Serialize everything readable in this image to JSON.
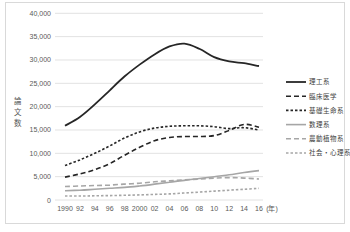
{
  "chart_data": {
    "type": "line",
    "title": "",
    "ylabel": "論文数",
    "x_unit_label": "(年)",
    "categories": [
      1990,
      1992,
      1994,
      1996,
      1998,
      2000,
      2002,
      2004,
      2006,
      2008,
      2010,
      2012,
      2014,
      2016
    ],
    "x_tick_labels": [
      "1990",
      "92",
      "94",
      "96",
      "98",
      "2000",
      "02",
      "04",
      "06",
      "08",
      "10",
      "12",
      "14",
      "16"
    ],
    "ylim": [
      0,
      40000
    ],
    "ytick_step": 5000,
    "y_tick_labels": [
      "0",
      "5,000",
      "10,000",
      "15,000",
      "20,000",
      "25,000",
      "30,000",
      "35,000",
      "40,000"
    ],
    "grid": "horizontal",
    "legend_position": "right",
    "series": [
      {
        "name": "理工系",
        "color": "#262626",
        "style": "solid",
        "width": 1.8,
        "values": [
          15900,
          17800,
          20500,
          23500,
          26500,
          29000,
          31200,
          32900,
          33500,
          32400,
          30600,
          29700,
          29300,
          28700
        ]
      },
      {
        "name": "臨床医学",
        "color": "#262626",
        "style": "dash",
        "width": 1.6,
        "values": [
          4900,
          5600,
          6500,
          7800,
          9600,
          11300,
          12700,
          13400,
          13600,
          13600,
          13800,
          14900,
          16200,
          15600
        ]
      },
      {
        "name": "基礎生命系",
        "color": "#262626",
        "style": "short-dash",
        "width": 1.6,
        "values": [
          7400,
          8600,
          10000,
          11600,
          13300,
          14600,
          15400,
          15800,
          15900,
          15900,
          15700,
          15300,
          15500,
          15000
        ]
      },
      {
        "name": "数理系",
        "color": "#a6a6a6",
        "style": "solid",
        "width": 1.6,
        "values": [
          2000,
          2100,
          2300,
          2500,
          2700,
          3000,
          3400,
          3800,
          4200,
          4600,
          5000,
          5400,
          5900,
          6300
        ]
      },
      {
        "name": "農動植物系",
        "color": "#a6a6a6",
        "style": "dash",
        "width": 1.6,
        "values": [
          2900,
          3000,
          3100,
          3200,
          3400,
          3600,
          3900,
          4100,
          4300,
          4500,
          4700,
          4800,
          4700,
          4500
        ]
      },
      {
        "name": "社会・心理系",
        "color": "#a6a6a6",
        "style": "short-dash",
        "width": 1.6,
        "values": [
          850,
          850,
          900,
          950,
          1000,
          1100,
          1200,
          1300,
          1500,
          1700,
          1900,
          2100,
          2300,
          2500
        ]
      }
    ]
  }
}
